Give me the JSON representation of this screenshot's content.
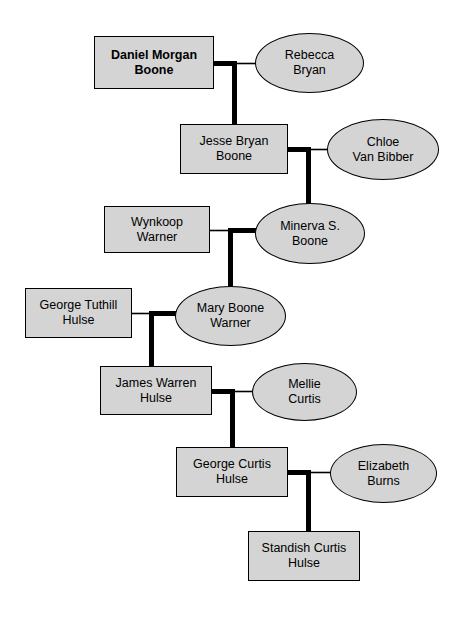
{
  "chart": {
    "width": 468,
    "height": 619,
    "background_color": "#ffffff",
    "node_fill_color": "#d4d4d4",
    "node_border_color": "#000000",
    "line_color": "#000000"
  },
  "generations": [
    {
      "index": 1,
      "person": {
        "name": "Daniel Morgan\nBoone",
        "shape": "rectangle",
        "highlighted": true,
        "x": 94,
        "y": 36,
        "w": 120,
        "h": 53
      },
      "spouse": {
        "name": "Rebecca\nBryan",
        "shape": "ellipse",
        "highlighted": false,
        "x": 255,
        "y": 33,
        "w": 109,
        "h": 60
      }
    },
    {
      "index": 2,
      "person": {
        "name": "Jesse Bryan\nBoone",
        "shape": "rectangle",
        "highlighted": false,
        "x": 180,
        "y": 124,
        "w": 108,
        "h": 50
      },
      "spouse": {
        "name": "Chloe\nVan Bibber",
        "shape": "ellipse",
        "highlighted": false,
        "x": 327,
        "y": 119,
        "w": 112,
        "h": 61
      }
    },
    {
      "index": 3,
      "person": {
        "name": "Minerva S.\nBoone",
        "shape": "ellipse",
        "highlighted": false,
        "x": 255,
        "y": 203,
        "w": 110,
        "h": 61
      },
      "spouse": {
        "name": "Wynkoop\nWarner",
        "shape": "rectangle",
        "highlighted": false,
        "x": 104,
        "y": 206,
        "w": 106,
        "h": 47
      }
    },
    {
      "index": 4,
      "person": {
        "name": "Mary Boone\nWarner",
        "shape": "ellipse",
        "highlighted": false,
        "x": 175,
        "y": 286,
        "w": 111,
        "h": 60
      },
      "spouse": {
        "name": "George Tuthill\nHulse",
        "shape": "rectangle",
        "highlighted": false,
        "x": 25,
        "y": 288,
        "w": 107,
        "h": 50
      }
    },
    {
      "index": 5,
      "person": {
        "name": "James Warren\nHulse",
        "shape": "rectangle",
        "highlighted": false,
        "x": 100,
        "y": 366,
        "w": 112,
        "h": 49
      },
      "spouse": {
        "name": "Mellie\nCurtis",
        "shape": "ellipse",
        "highlighted": false,
        "x": 252,
        "y": 363,
        "w": 105,
        "h": 58
      }
    },
    {
      "index": 6,
      "person": {
        "name": "George Curtis\nHulse",
        "shape": "rectangle",
        "highlighted": false,
        "x": 176,
        "y": 447,
        "w": 112,
        "h": 50
      },
      "spouse": {
        "name": "Elizabeth\nBurns",
        "shape": "ellipse",
        "highlighted": false,
        "x": 330,
        "y": 444,
        "w": 107,
        "h": 59
      }
    },
    {
      "index": 7,
      "person": {
        "name": "Standish Curtis\nHulse",
        "shape": "rectangle",
        "highlighted": false,
        "x": 248,
        "y": 531,
        "w": 112,
        "h": 50
      },
      "spouse": null
    }
  ]
}
